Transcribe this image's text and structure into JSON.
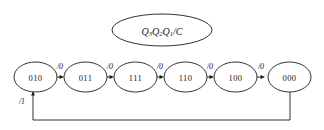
{
  "diagram": {
    "type": "state-transition-diagram",
    "title": "",
    "legend": {
      "text": "Q3Q2Q1/C",
      "parts": [
        {
          "base": "Q",
          "sub": "3"
        },
        {
          "base": "Q",
          "sub": "2"
        },
        {
          "base": "Q",
          "sub": "1"
        },
        {
          "base": "/C",
          "sub": ""
        }
      ]
    },
    "states": [
      {
        "id": "s0",
        "label": "010",
        "cx": 35.5,
        "cy": 77
      },
      {
        "id": "s1",
        "label": "011",
        "cx": 85.5,
        "cy": 77
      },
      {
        "id": "s2",
        "label": "111",
        "cx": 135.5,
        "cy": 77
      },
      {
        "id": "s3",
        "label": "110",
        "cx": 185.5,
        "cy": 77
      },
      {
        "id": "s4",
        "label": "100",
        "cx": 235.5,
        "cy": 77
      },
      {
        "id": "s5",
        "label": "000",
        "cx": 289.5,
        "cy": 77
      }
    ],
    "transitions": [
      {
        "from": "010",
        "to": "011",
        "label": "/0",
        "lx": 60,
        "ly": 66
      },
      {
        "from": "011",
        "to": "111",
        "label": "/0",
        "lx": 110,
        "ly": 66
      },
      {
        "from": "111",
        "to": "110",
        "label": "/0",
        "lx": 160,
        "ly": 66
      },
      {
        "from": "110",
        "to": "100",
        "label": "/0",
        "lx": 210,
        "ly": 66
      },
      {
        "from": "100",
        "to": "000",
        "label": "/0",
        "lx": 261,
        "ly": 66
      },
      {
        "from": "000",
        "to": "010",
        "label": "/1",
        "lx": 22,
        "ly": 101
      }
    ],
    "geometry": {
      "node_rx": 21.5,
      "node_ry": 15,
      "legend_cx": 162,
      "legend_cy": 30,
      "legend_rx": 50,
      "legend_ry": 16,
      "feedback_y": 120,
      "feedback_left_x": 33,
      "feedback_right_x": 290
    },
    "colors": {
      "stroke": "#1a1a1a",
      "background": "#ffffff",
      "fill": "#ffffff"
    }
  }
}
